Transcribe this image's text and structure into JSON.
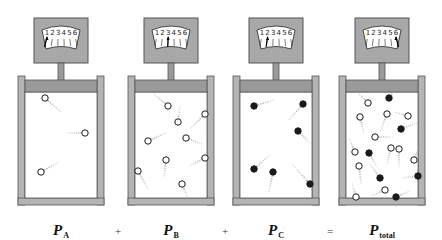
{
  "colors": {
    "wall": "#b4b4b4",
    "wall_edge": "#555555",
    "piston": "#9a9a9a",
    "gauge_box": "#a8a8a8",
    "dial_face": "#ffffff",
    "ink": "#222222",
    "trail": "#aaaaaa"
  },
  "gauge_scale": [
    "1",
    "2",
    "3",
    "4",
    "5",
    "6"
  ],
  "containers": [
    {
      "id": "A",
      "x": 18,
      "gauge_reading": 1,
      "label": {
        "main": "P",
        "sub": "A"
      },
      "molecules": [
        {
          "x": 45,
          "y": 98,
          "type": "open",
          "dx": 16,
          "dy": 14
        },
        {
          "x": 85,
          "y": 133,
          "type": "open",
          "dx": -18,
          "dy": 0
        },
        {
          "x": 41,
          "y": 172,
          "type": "open",
          "dx": 18,
          "dy": -10
        }
      ]
    },
    {
      "id": "B",
      "x": 128,
      "gauge_reading": 3,
      "label": {
        "main": "P",
        "sub": "B"
      },
      "molecules": [
        {
          "x": 168,
          "y": 106,
          "type": "open",
          "dx": -14,
          "dy": -12
        },
        {
          "x": 178,
          "y": 122,
          "type": "open",
          "dx": 2,
          "dy": -16
        },
        {
          "x": 205,
          "y": 114,
          "type": "open",
          "dx": -14,
          "dy": 14
        },
        {
          "x": 148,
          "y": 141,
          "type": "open",
          "dx": 18,
          "dy": -8
        },
        {
          "x": 186,
          "y": 138,
          "type": "open",
          "dx": 16,
          "dy": 6
        },
        {
          "x": 205,
          "y": 158,
          "type": "open",
          "dx": -16,
          "dy": 8
        },
        {
          "x": 166,
          "y": 160,
          "type": "open",
          "dx": -2,
          "dy": 18
        },
        {
          "x": 138,
          "y": 171,
          "type": "open",
          "dx": 10,
          "dy": 18
        },
        {
          "x": 182,
          "y": 184,
          "type": "open",
          "dx": 6,
          "dy": 14
        }
      ]
    },
    {
      "id": "C",
      "x": 233,
      "gauge_reading": 2,
      "label": {
        "main": "P",
        "sub": "C"
      },
      "molecules": [
        {
          "x": 254,
          "y": 106,
          "type": "filled",
          "dx": 20,
          "dy": -6
        },
        {
          "x": 303,
          "y": 104,
          "type": "filled",
          "dx": -14,
          "dy": 16
        },
        {
          "x": 298,
          "y": 131,
          "type": "filled",
          "dx": 12,
          "dy": 12
        },
        {
          "x": 254,
          "y": 169,
          "type": "filled",
          "dx": 16,
          "dy": -14
        },
        {
          "x": 273,
          "y": 172,
          "type": "filled",
          "dx": -4,
          "dy": 20
        },
        {
          "x": 310,
          "y": 184,
          "type": "filled",
          "dx": -18,
          "dy": -20
        }
      ]
    },
    {
      "id": "total",
      "x": 339,
      "gauge_reading": 6,
      "label": {
        "main": "P",
        "sub": "total"
      },
      "molecules": [
        {
          "x": 368,
          "y": 103,
          "type": "open",
          "dx": -10,
          "dy": -10
        },
        {
          "x": 389,
          "y": 98,
          "type": "filled",
          "dx": 8,
          "dy": -10
        },
        {
          "x": 360,
          "y": 117,
          "type": "open",
          "dx": 4,
          "dy": 16
        },
        {
          "x": 387,
          "y": 114,
          "type": "open",
          "dx": -6,
          "dy": 16
        },
        {
          "x": 408,
          "y": 116,
          "type": "open",
          "dx": -14,
          "dy": -4
        },
        {
          "x": 401,
          "y": 129,
          "type": "filled",
          "dx": 16,
          "dy": -6
        },
        {
          "x": 375,
          "y": 137,
          "type": "open",
          "dx": 18,
          "dy": 0
        },
        {
          "x": 355,
          "y": 152,
          "type": "open",
          "dx": -6,
          "dy": -14
        },
        {
          "x": 369,
          "y": 153,
          "type": "filled",
          "dx": 8,
          "dy": 14
        },
        {
          "x": 391,
          "y": 148,
          "type": "open",
          "dx": -4,
          "dy": 16
        },
        {
          "x": 399,
          "y": 149,
          "type": "open",
          "dx": 0,
          "dy": 18
        },
        {
          "x": 414,
          "y": 160,
          "type": "open",
          "dx": 6,
          "dy": -16
        },
        {
          "x": 359,
          "y": 166,
          "type": "open",
          "dx": 2,
          "dy": 18
        },
        {
          "x": 380,
          "y": 178,
          "type": "filled",
          "dx": -10,
          "dy": -14
        },
        {
          "x": 418,
          "y": 176,
          "type": "filled",
          "dx": -16,
          "dy": 2
        },
        {
          "x": 385,
          "y": 190,
          "type": "open",
          "dx": -14,
          "dy": 6
        },
        {
          "x": 356,
          "y": 197,
          "type": "open",
          "dx": -4,
          "dy": -14
        },
        {
          "x": 396,
          "y": 197,
          "type": "filled",
          "dx": 14,
          "dy": -6
        }
      ]
    }
  ],
  "operators": [
    {
      "symbol": "+",
      "x": 118
    },
    {
      "symbol": "+",
      "x": 225
    },
    {
      "symbol": "=",
      "x": 330
    }
  ]
}
